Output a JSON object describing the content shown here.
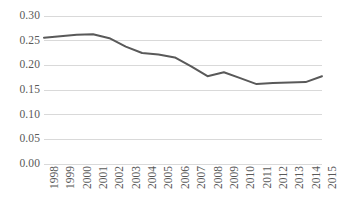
{
  "chart_data": {
    "type": "line",
    "title": "",
    "subtitle": "",
    "xlabel": "",
    "ylabel": "",
    "categories": [
      "1998",
      "1999",
      "2000",
      "2001",
      "2002",
      "2003",
      "2004",
      "2005",
      "2006",
      "2007",
      "2008",
      "2009",
      "2010",
      "2011",
      "2012",
      "2013",
      "2014",
      "2015"
    ],
    "values": [
      0.256,
      0.259,
      0.262,
      0.263,
      0.255,
      0.238,
      0.225,
      0.222,
      0.216,
      0.198,
      0.178,
      0.186,
      0.174,
      0.162,
      0.164,
      0.165,
      0.166,
      0.178
    ],
    "series": [
      {
        "name": "series-1",
        "color": "#595959",
        "values": [
          0.256,
          0.259,
          0.262,
          0.263,
          0.255,
          0.238,
          0.225,
          0.222,
          0.216,
          0.198,
          0.178,
          0.186,
          0.174,
          0.162,
          0.164,
          0.165,
          0.166,
          0.178
        ]
      }
    ],
    "ylim": [
      0.0,
      0.3
    ],
    "ytick_values": [
      0.0,
      0.05,
      0.1,
      0.15,
      0.2,
      0.25,
      0.3
    ],
    "ytick_labels": [
      "0.00",
      "0.05",
      "0.10",
      "0.15",
      "0.20",
      "0.25",
      "0.30"
    ],
    "grid": "horizontal",
    "gridline_color": "#d9d9d9",
    "legend": "none",
    "legend_position": "none",
    "markers": false,
    "line_width_px": 2,
    "annotations": []
  },
  "axes": {
    "y_labels": [
      "0.30",
      "0.25",
      "0.20",
      "0.15",
      "0.10",
      "0.05",
      "0.00"
    ],
    "x_labels": [
      "1998",
      "1999",
      "2000",
      "2001",
      "2002",
      "2003",
      "2004",
      "2005",
      "2006",
      "2007",
      "2008",
      "2009",
      "2010",
      "2011",
      "2012",
      "2013",
      "2014",
      "2015"
    ]
  },
  "colors": {
    "line": "#595959",
    "text": "#595959",
    "grid": "#d9d9d9",
    "background": "#ffffff"
  }
}
